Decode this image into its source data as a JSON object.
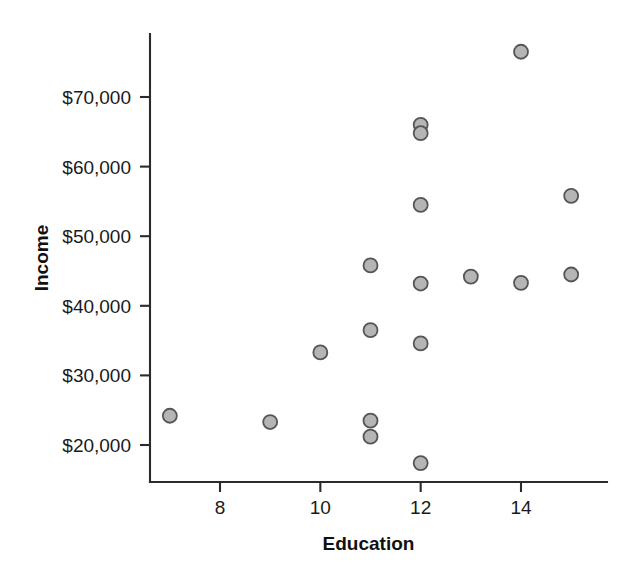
{
  "chart_data": {
    "type": "scatter",
    "title": "",
    "xlabel": "Education",
    "ylabel": "Income",
    "xlim": [
      6.3,
      15.6
    ],
    "ylim": [
      14500,
      79500
    ],
    "grid": false,
    "legend": null,
    "x_ticks": [
      {
        "value": 8,
        "label": "8"
      },
      {
        "value": 10,
        "label": "10"
      },
      {
        "value": 12,
        "label": "12"
      },
      {
        "value": 14,
        "label": "14"
      }
    ],
    "y_ticks": [
      {
        "value": 20000,
        "label": "$20,000"
      },
      {
        "value": 30000,
        "label": "$30,000"
      },
      {
        "value": 40000,
        "label": "$40,000"
      },
      {
        "value": 50000,
        "label": "$50,000"
      },
      {
        "value": 60000,
        "label": "$60,000"
      },
      {
        "value": 70000,
        "label": "$70,000"
      }
    ],
    "marker": {
      "shape": "circle",
      "fill": "#b5b5b5",
      "edge": "#555555",
      "radius": 7
    },
    "points": [
      {
        "x": 7,
        "y": 24200
      },
      {
        "x": 9,
        "y": 23300
      },
      {
        "x": 10,
        "y": 33300
      },
      {
        "x": 11,
        "y": 45800
      },
      {
        "x": 11,
        "y": 36500
      },
      {
        "x": 11,
        "y": 23500
      },
      {
        "x": 11,
        "y": 21200
      },
      {
        "x": 12,
        "y": 66000
      },
      {
        "x": 12,
        "y": 64800
      },
      {
        "x": 12,
        "y": 54500
      },
      {
        "x": 12,
        "y": 43200
      },
      {
        "x": 12,
        "y": 34600
      },
      {
        "x": 12,
        "y": 17400
      },
      {
        "x": 13,
        "y": 44200
      },
      {
        "x": 14,
        "y": 76500
      },
      {
        "x": 14,
        "y": 43300
      },
      {
        "x": 15,
        "y": 55800
      },
      {
        "x": 15,
        "y": 44500
      }
    ]
  },
  "colors": {
    "axis": "#2b2b2b",
    "text": "#111111",
    "marker_fill": "#b5b5b5",
    "marker_edge": "#555555",
    "background": "#ffffff"
  }
}
